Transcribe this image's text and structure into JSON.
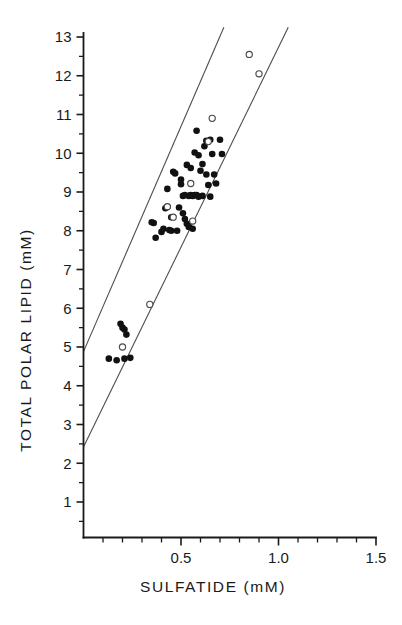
{
  "chart_data": {
    "type": "scatter",
    "title": "",
    "xlabel": "SULFATIDE  (mM)",
    "ylabel": "TOTAL POLAR LIPID (mM)",
    "xlim": [
      0.0,
      1.5
    ],
    "ylim": [
      0.0,
      13.0
    ],
    "xticks_major": [
      0.5,
      1.0,
      1.5
    ],
    "xticks_major_labels": [
      "0.5",
      "1.0",
      "1.5"
    ],
    "xticks_minor": [
      0.1,
      0.2,
      0.3,
      0.4,
      0.6,
      0.7,
      0.8,
      0.9,
      1.1,
      1.2,
      1.3,
      1.4
    ],
    "yticks_major": [
      1,
      2,
      3,
      4,
      5,
      6,
      7,
      8,
      9,
      10,
      11,
      12,
      13
    ],
    "yticks_major_labels": [
      "1",
      "2",
      "3",
      "4",
      "5",
      "6",
      "7",
      "8",
      "9",
      "10",
      "11",
      "12",
      "13"
    ],
    "yticks_minor": [
      0.5,
      1.5,
      2.5,
      3.5,
      4.5,
      5.5,
      6.5,
      7.5,
      8.5,
      9.5,
      10.5,
      11.5,
      12.5
    ],
    "grid": false,
    "legend": false,
    "legend_position": "none",
    "series": [
      {
        "name": "filled-circles",
        "marker": "filled-circle",
        "color": "#111111",
        "points": [
          [
            0.13,
            4.7
          ],
          [
            0.17,
            4.66
          ],
          [
            0.19,
            5.6
          ],
          [
            0.2,
            5.5
          ],
          [
            0.21,
            5.45
          ],
          [
            0.21,
            4.7
          ],
          [
            0.22,
            5.32
          ],
          [
            0.24,
            4.72
          ],
          [
            0.35,
            8.22
          ],
          [
            0.36,
            8.2
          ],
          [
            0.37,
            7.82
          ],
          [
            0.4,
            7.97
          ],
          [
            0.41,
            8.05
          ],
          [
            0.42,
            8.58
          ],
          [
            0.43,
            8.62
          ],
          [
            0.43,
            9.08
          ],
          [
            0.44,
            8.02
          ],
          [
            0.45,
            8.0
          ],
          [
            0.45,
            8.35
          ],
          [
            0.46,
            9.52
          ],
          [
            0.47,
            9.48
          ],
          [
            0.48,
            8.0
          ],
          [
            0.49,
            8.6
          ],
          [
            0.5,
            9.2
          ],
          [
            0.5,
            9.32
          ],
          [
            0.51,
            8.45
          ],
          [
            0.51,
            8.9
          ],
          [
            0.52,
            8.3
          ],
          [
            0.52,
            8.92
          ],
          [
            0.53,
            8.18
          ],
          [
            0.53,
            9.7
          ],
          [
            0.54,
            8.1
          ],
          [
            0.54,
            8.9
          ],
          [
            0.55,
            8.92
          ],
          [
            0.55,
            9.62
          ],
          [
            0.56,
            8.9
          ],
          [
            0.56,
            8.05
          ],
          [
            0.57,
            8.92
          ],
          [
            0.57,
            10.02
          ],
          [
            0.58,
            8.92
          ],
          [
            0.58,
            10.58
          ],
          [
            0.59,
            9.95
          ],
          [
            0.59,
            8.88
          ],
          [
            0.6,
            9.55
          ],
          [
            0.61,
            8.9
          ],
          [
            0.61,
            9.72
          ],
          [
            0.62,
            10.18
          ],
          [
            0.63,
            9.45
          ],
          [
            0.63,
            10.32
          ],
          [
            0.64,
            9.18
          ],
          [
            0.65,
            8.88
          ],
          [
            0.65,
            10.35
          ],
          [
            0.66,
            9.98
          ],
          [
            0.67,
            9.45
          ],
          [
            0.68,
            9.22
          ],
          [
            0.7,
            10.35
          ],
          [
            0.71,
            9.98
          ]
        ]
      },
      {
        "name": "open-circles",
        "marker": "open-circle",
        "color": "#ffffff",
        "points": [
          [
            0.2,
            5.0
          ],
          [
            0.34,
            6.1
          ],
          [
            0.43,
            8.62
          ],
          [
            0.46,
            8.35
          ],
          [
            0.55,
            9.22
          ],
          [
            0.56,
            8.25
          ],
          [
            0.64,
            10.3
          ],
          [
            0.66,
            10.9
          ],
          [
            0.85,
            12.55
          ],
          [
            0.9,
            12.05
          ]
        ]
      }
    ],
    "reference_lines": [
      {
        "name": "upper-band-line",
        "x": [
          0.0,
          0.72
        ],
        "y": [
          4.88,
          13.25
        ]
      },
      {
        "name": "lower-band-line",
        "x": [
          0.0,
          1.05
        ],
        "y": [
          2.42,
          13.25
        ]
      }
    ]
  }
}
